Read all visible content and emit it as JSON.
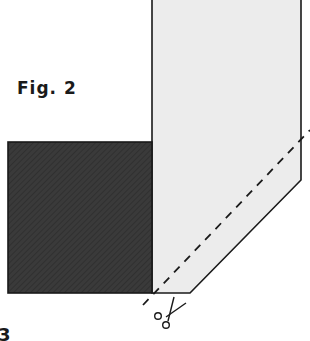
{
  "figure": {
    "label": "Fig. 2",
    "partial_next_label": "3"
  },
  "shapes": {
    "dark_square": {
      "fill": "#3a3a3a",
      "stroke": "#1a1a1a"
    },
    "light_panel": {
      "fill": "#ececec",
      "stroke": "#1a1a1a"
    },
    "cut_line": {
      "stroke": "#1a1a1a",
      "style": "dashed"
    }
  },
  "icons": {
    "scissors": "scissors-icon"
  }
}
